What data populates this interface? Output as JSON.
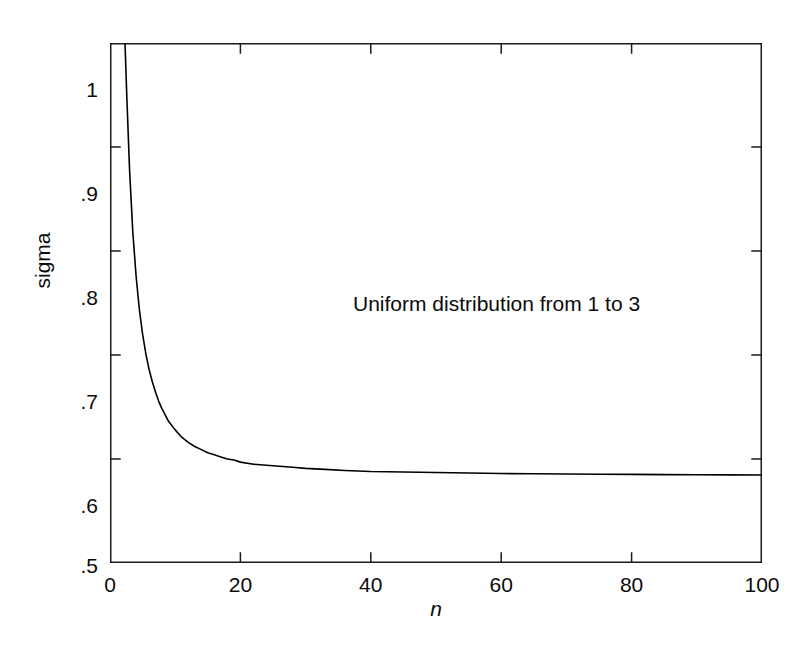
{
  "chart_data": {
    "type": "line",
    "title": "",
    "subtitle": "",
    "xlabel": "n",
    "ylabel": "sigma",
    "xlim": [
      0,
      100
    ],
    "ylim": [
      0.5,
      1.0
    ],
    "grid": false,
    "legend": "none",
    "annotations": [
      {
        "text": "Uniform distribution from 1 to 3",
        "x": 23,
        "y": 0.8
      }
    ],
    "xticks": [
      0,
      20,
      40,
      60,
      80,
      100
    ],
    "xtick_labels": [
      "0",
      "20",
      "40",
      "60",
      "80",
      "100"
    ],
    "yticks": [
      0.5,
      0.6,
      0.7,
      0.8,
      0.9,
      1.0
    ],
    "ytick_labels": [
      ".5",
      ".6",
      ".7",
      ".8",
      ".9",
      "1"
    ],
    "line_color": "#000000",
    "line_width": 1.6,
    "asymptote": 0.5774,
    "series": [
      {
        "name": "sigma vs n",
        "x": [
          2.3,
          2.6,
          3,
          3.5,
          4,
          4.5,
          5,
          5.5,
          6,
          6.5,
          7,
          7.5,
          8,
          9,
          10,
          11,
          12,
          13,
          14,
          15,
          16,
          17,
          18,
          19,
          20,
          22,
          24,
          26,
          28,
          30,
          33,
          36,
          40,
          45,
          50,
          55,
          60,
          65,
          70,
          75,
          80,
          85,
          90,
          95,
          100
        ],
        "y": [
          1.0,
          0.945,
          0.878,
          0.818,
          0.776,
          0.744,
          0.72,
          0.701,
          0.686,
          0.674,
          0.664,
          0.655,
          0.648,
          0.636,
          0.628,
          0.621,
          0.616,
          0.612,
          0.609,
          0.606,
          0.604,
          0.602,
          0.6,
          0.599,
          0.597,
          0.595,
          0.594,
          0.593,
          0.592,
          0.591,
          0.59,
          0.589,
          0.588,
          0.5875,
          0.587,
          0.5865,
          0.586,
          0.5858,
          0.5856,
          0.5854,
          0.5852,
          0.585,
          0.5848,
          0.5847,
          0.5846
        ]
      }
    ]
  }
}
